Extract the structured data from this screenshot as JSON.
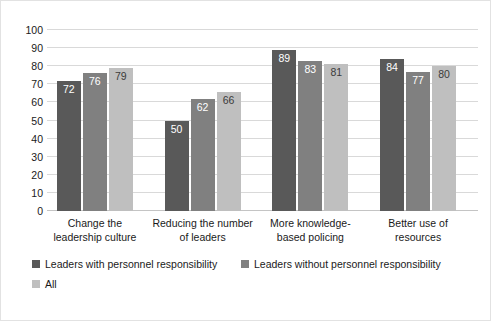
{
  "chart_data": {
    "type": "bar",
    "title": "",
    "subtitle": "",
    "xlabel": "",
    "ylabel": "",
    "ylim": [
      0,
      100
    ],
    "yticks": [
      100,
      90,
      80,
      70,
      60,
      50,
      40,
      30,
      20,
      10,
      0
    ],
    "grid": true,
    "legend_position": "bottom",
    "orientation": "vertical",
    "grouping": "clustered",
    "categories": [
      "Change the leadership culture",
      "Reducing the number of leaders",
      "More knowledge-based policing",
      "Better use of resources"
    ],
    "category_label_lines": [
      [
        "Change the",
        "leadership culture"
      ],
      [
        "Reducing the number",
        "of leaders"
      ],
      [
        "More knowledge-",
        "based policing"
      ],
      [
        "Better use of",
        "resources"
      ]
    ],
    "series": [
      {
        "name": "Leaders with personnel responsibility",
        "color": "#595959",
        "values": [
          72,
          50,
          89,
          84
        ]
      },
      {
        "name": "Leaders without personnel responsibility",
        "color": "#808080",
        "values": [
          76,
          62,
          83,
          77
        ]
      },
      {
        "name": "All",
        "color": "#bfbfbf",
        "values": [
          79,
          66,
          81,
          80
        ]
      }
    ]
  },
  "legend": {
    "rows": [
      [
        {
          "label": "Leaders with personnel responsibility",
          "color": "#595959",
          "left": 0
        },
        {
          "label": "Leaders without personnel responsibility",
          "color": "#808080",
          "left": 209
        }
      ],
      [
        {
          "label": "All",
          "color": "#bfbfbf",
          "left": 0
        }
      ]
    ]
  },
  "colors": {
    "gridline": "#d9d9d9",
    "baseline": "#c4c4c4",
    "border": "#e2e2e2",
    "background": "#ffffff",
    "text": "#1a1a1a"
  }
}
